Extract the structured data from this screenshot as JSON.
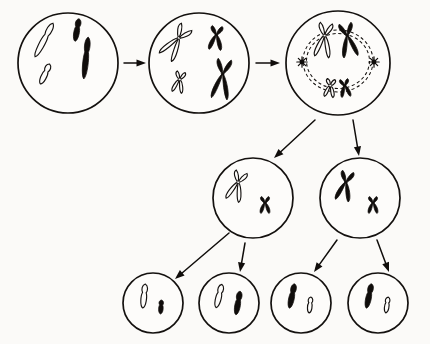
{
  "figure": {
    "background_color": "#fbfaf8",
    "ink_color": "#100d0b",
    "light_chromosome_fill": "#fdfcfa",
    "width": 430,
    "height": 344,
    "label_text": ""
  },
  "chart_data": {
    "type": "diagram",
    "stage_count": 9,
    "generations": [
      {
        "row": 1,
        "name": "parent-row",
        "cells": [
          {
            "id": "cell-1",
            "stage_label": "",
            "cx": 68,
            "cy": 63,
            "r": 50,
            "nuclear_envelope": false,
            "chromosomes": [
              {
                "name": "long-light-chromatid",
                "shade": "light",
                "size": "long",
                "replicated": false,
                "x": 44,
                "y": 40,
                "length": 38,
                "angle": 28
              },
              {
                "name": "short-light-chromatid",
                "shade": "light",
                "size": "short",
                "replicated": false,
                "x": 45,
                "y": 74,
                "length": 22,
                "angle": 25
              },
              {
                "name": "short-dark-chromatid",
                "shade": "dark",
                "size": "short",
                "replicated": false,
                "x": 77,
                "y": 30,
                "length": 23,
                "angle": 10
              },
              {
                "name": "long-dark-chromatid",
                "shade": "dark",
                "size": "long",
                "replicated": false,
                "x": 86,
                "y": 58,
                "length": 42,
                "angle": 6
              }
            ]
          },
          {
            "id": "cell-2",
            "stage_label": "",
            "cx": 199,
            "cy": 63,
            "r": 50,
            "nuclear_envelope": false,
            "chromosomes": [
              {
                "name": "long-light-chromosome",
                "shade": "light",
                "size": "long",
                "replicated": true,
                "x": 176,
                "y": 42,
                "length": 37,
                "angle": 35
              },
              {
                "name": "short-light-chromosome",
                "shade": "light",
                "size": "short",
                "replicated": true,
                "x": 179,
                "y": 82,
                "length": 21,
                "angle": 12
              },
              {
                "name": "short-dark-chromosome",
                "shade": "dark",
                "size": "short",
                "replicated": true,
                "x": 216,
                "y": 38,
                "length": 24,
                "angle": 6
              },
              {
                "name": "long-dark-chromosome",
                "shade": "dark",
                "size": "long",
                "replicated": true,
                "x": 222,
                "y": 79,
                "length": 40,
                "angle": 8
              }
            ]
          },
          {
            "id": "cell-3",
            "stage_label": "",
            "cx": 338,
            "cy": 63,
            "r": 52,
            "nuclear_envelope": true,
            "envelope_rx": 35,
            "envelope_ry": 31,
            "centrosomes": 2,
            "chromosomes": [
              {
                "name": "long-light-chromosome",
                "shade": "light",
                "size": "long",
                "replicated": true,
                "x": 324,
                "y": 40,
                "length": 34,
                "angle": 8
              },
              {
                "name": "long-dark-chromosome",
                "shade": "dark",
                "size": "long",
                "replicated": true,
                "x": 348,
                "y": 40,
                "length": 34,
                "angle": -10
              },
              {
                "name": "short-light-chromosome",
                "shade": "light",
                "size": "short",
                "replicated": true,
                "x": 330,
                "y": 88,
                "length": 18,
                "angle": 8
              },
              {
                "name": "short-dark-chromosome",
                "shade": "dark",
                "size": "short",
                "replicated": true,
                "x": 345,
                "y": 88,
                "length": 18,
                "angle": -8
              }
            ]
          }
        ]
      },
      {
        "row": 2,
        "name": "daughter-row",
        "cells": [
          {
            "id": "cell-4",
            "stage_label": "",
            "cx": 253,
            "cy": 198,
            "r": 40,
            "nuclear_envelope": false,
            "chromosomes": [
              {
                "name": "long-light-chromosome",
                "shade": "light",
                "size": "long",
                "replicated": true,
                "x": 237,
                "y": 186,
                "length": 30,
                "angle": 18
              },
              {
                "name": "short-dark-chromosome",
                "shade": "dark",
                "size": "short",
                "replicated": true,
                "x": 265,
                "y": 205,
                "length": 17,
                "angle": 0
              }
            ]
          },
          {
            "id": "cell-5",
            "stage_label": "",
            "cx": 360,
            "cy": 198,
            "r": 40,
            "nuclear_envelope": false,
            "chromosomes": [
              {
                "name": "long-dark-chromosome",
                "shade": "dark",
                "size": "long",
                "replicated": true,
                "x": 345,
                "y": 186,
                "length": 30,
                "angle": 12
              },
              {
                "name": "short-dark-chromosome",
                "shade": "dark",
                "size": "short",
                "replicated": true,
                "x": 373,
                "y": 205,
                "length": 17,
                "angle": 0
              }
            ]
          }
        ]
      },
      {
        "row": 3,
        "name": "gamete-row",
        "cells": [
          {
            "id": "cell-6",
            "stage_label": "",
            "cx": 153,
            "cy": 303,
            "r": 30,
            "nuclear_envelope": false,
            "chromosomes": [
              {
                "name": "long-light-chromatid",
                "shade": "light",
                "size": "long",
                "replicated": false,
                "x": 144,
                "y": 296,
                "length": 24,
                "angle": 6
              },
              {
                "name": "short-dark-chromatid",
                "shade": "dark",
                "size": "short",
                "replicated": false,
                "x": 161,
                "y": 307,
                "length": 14,
                "angle": 4
              }
            ]
          },
          {
            "id": "cell-7",
            "stage_label": "",
            "cx": 229,
            "cy": 303,
            "r": 30,
            "nuclear_envelope": false,
            "chromosomes": [
              {
                "name": "long-light-chromatid",
                "shade": "light",
                "size": "long",
                "replicated": false,
                "x": 219,
                "y": 296,
                "length": 24,
                "angle": 14
              },
              {
                "name": "long-dark-chromatid",
                "shade": "dark",
                "size": "long",
                "replicated": false,
                "x": 238,
                "y": 303,
                "length": 24,
                "angle": 10
              }
            ]
          },
          {
            "id": "cell-8",
            "stage_label": "",
            "cx": 301,
            "cy": 303,
            "r": 30,
            "nuclear_envelope": false,
            "chromosomes": [
              {
                "name": "long-dark-chromatid",
                "shade": "dark",
                "size": "long",
                "replicated": false,
                "x": 292,
                "y": 296,
                "length": 25,
                "angle": 12
              },
              {
                "name": "short-light-chromatid",
                "shade": "light",
                "size": "short",
                "replicated": false,
                "x": 310,
                "y": 305,
                "length": 16,
                "angle": 6
              }
            ]
          },
          {
            "id": "cell-9",
            "stage_label": "",
            "cx": 378,
            "cy": 303,
            "r": 30,
            "nuclear_envelope": false,
            "chromosomes": [
              {
                "name": "long-dark-chromatid",
                "shade": "dark",
                "size": "long",
                "replicated": false,
                "x": 369,
                "y": 296,
                "length": 25,
                "angle": 12
              },
              {
                "name": "short-light-chromatid",
                "shade": "light",
                "size": "short",
                "replicated": false,
                "x": 387,
                "y": 305,
                "length": 16,
                "angle": 8
              }
            ]
          }
        ]
      }
    ],
    "arrows": [
      {
        "id": "arrow-1-2",
        "name": "arrow-cell1-to-cell2",
        "from": "cell-1",
        "to": "cell-2",
        "x1": 124,
        "y1": 63,
        "x2": 146,
        "y2": 63,
        "direction": "right"
      },
      {
        "id": "arrow-2-3",
        "name": "arrow-cell2-to-cell3",
        "from": "cell-2",
        "to": "cell-3",
        "x1": 256,
        "y1": 63,
        "x2": 280,
        "y2": 63,
        "direction": "right"
      },
      {
        "id": "arrow-3-4",
        "name": "arrow-cell3-to-cell4",
        "from": "cell-3",
        "to": "cell-4",
        "x1": 315,
        "y1": 120,
        "x2": 274,
        "y2": 158,
        "direction": "down-left"
      },
      {
        "id": "arrow-3-5",
        "name": "arrow-cell3-to-cell5",
        "from": "cell-3",
        "to": "cell-5",
        "x1": 353,
        "y1": 120,
        "x2": 359,
        "y2": 156,
        "direction": "down"
      },
      {
        "id": "arrow-4-6",
        "name": "arrow-cell4-to-cell6",
        "from": "cell-4",
        "to": "cell-6",
        "x1": 229,
        "y1": 233,
        "x2": 175,
        "y2": 279,
        "direction": "down-left"
      },
      {
        "id": "arrow-4-7",
        "name": "arrow-cell4-to-cell7",
        "from": "cell-4",
        "to": "cell-7",
        "x1": 245,
        "y1": 243,
        "x2": 240,
        "y2": 272,
        "direction": "down"
      },
      {
        "id": "arrow-5-8",
        "name": "arrow-cell5-to-cell8",
        "from": "cell-5",
        "to": "cell-8",
        "x1": 337,
        "y1": 240,
        "x2": 314,
        "y2": 272,
        "direction": "down-left"
      },
      {
        "id": "arrow-5-9",
        "name": "arrow-cell5-to-cell9",
        "from": "cell-5",
        "to": "cell-9",
        "x1": 377,
        "y1": 240,
        "x2": 389,
        "y2": 272,
        "direction": "down-right"
      }
    ]
  }
}
